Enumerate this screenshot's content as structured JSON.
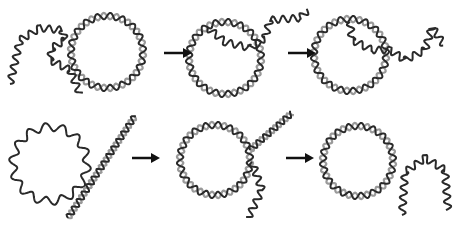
{
  "diagram": {
    "title": "DNA strand invasion into circular DNA",
    "rows": [
      {
        "name": "top-row",
        "stages": [
          {
            "name": "ssDNA-and-dsDNA-circle",
            "circle": {
              "cx": 107,
              "cy": 52,
              "r": 36,
              "type": "ds"
            },
            "strands": [
              {
                "type": "ss",
                "d": "M10,84 L20,40 L40,28 L62,30 L65,40 L52,48 L50,60 L70,70 L80,94"
              }
            ]
          },
          {
            "name": "invasion-start",
            "circle": {
              "cx": 225,
              "cy": 58,
              "r": 36,
              "type": "ds"
            },
            "strands": [
              {
                "type": "ss",
                "d": "M208,28 L225,42 L250,48 L265,38 L270,20 L300,18 L308,10"
              }
            ]
          },
          {
            "name": "invasion-progress",
            "circle": {
              "cx": 350,
              "cy": 55,
              "r": 36,
              "type": "ds"
            },
            "strands": [
              {
                "type": "ss",
                "d": "M350,22 L352,40 L372,50 L390,50 L405,60 L425,50 L432,27 L444,45"
              }
            ]
          }
        ],
        "arrows": [
          {
            "x1": 164,
            "y1": 53,
            "x2": 192,
            "y2": 53
          },
          {
            "x1": 288,
            "y1": 53,
            "x2": 316,
            "y2": 53
          }
        ]
      },
      {
        "name": "bottom-row",
        "stages": [
          {
            "name": "ssDNA-circle-and-linear-dsDNA",
            "circle": {
              "cx": 50,
              "cy": 164,
              "r": 37,
              "type": "ss"
            },
            "strands": [
              {
                "type": "ds",
                "d": "M68,218 L135,116"
              }
            ]
          },
          {
            "name": "annealing",
            "circle": {
              "cx": 215,
              "cy": 160,
              "r": 35,
              "type": "ds"
            },
            "strands": [
              {
                "type": "ds",
                "d": "M250,150 L292,113"
              },
              {
                "type": "ss",
                "d": "M252,162 L262,190 L248,218"
              }
            ]
          },
          {
            "name": "circular-dsDNA-product",
            "circle": {
              "cx": 358,
              "cy": 161,
              "r": 35,
              "type": "ds"
            },
            "strands": [
              {
                "type": "ss",
                "d": "M402,215 L405,172 L425,158 L445,170 L448,210"
              }
            ]
          }
        ],
        "arrows": [
          {
            "x1": 132,
            "y1": 158,
            "x2": 160,
            "y2": 158
          },
          {
            "x1": 286,
            "y1": 158,
            "x2": 314,
            "y2": 158
          }
        ]
      }
    ],
    "colors": {
      "strand": "#2a2a2a",
      "strand2": "#9a9a9a",
      "arrow": "#111111",
      "background": "#ffffff"
    }
  }
}
